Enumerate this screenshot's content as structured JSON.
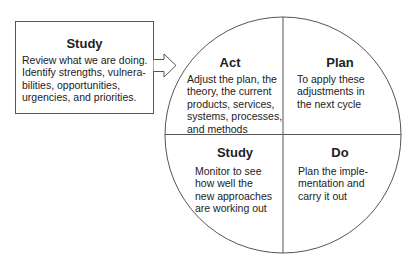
{
  "input_box": {
    "title": "Study",
    "lines": [
      "Review what we are doing.",
      "Identify strengths, vulnera-",
      "bilities, opportunities,",
      "urgencies, and priorities."
    ]
  },
  "cycle": {
    "quadrants": [
      {
        "position": "top-left",
        "title": "Act",
        "lines": [
          "Adjust the plan, the",
          "theory, the current",
          "products, services,",
          "systems, processes,",
          "and methods"
        ]
      },
      {
        "position": "top-right",
        "title": "Plan",
        "lines": [
          "To apply these",
          "adjustments in",
          "the next cycle"
        ]
      },
      {
        "position": "bottom-left",
        "title": "Study",
        "lines": [
          "Monitor to see",
          "how well the",
          "new approaches",
          "are working out"
        ]
      },
      {
        "position": "bottom-right",
        "title": "Do",
        "lines": [
          "Plan the imple-",
          "mentation and",
          "carry it out"
        ]
      }
    ]
  },
  "colors": {
    "line": "#555555",
    "text": "#222222",
    "background": "#ffffff"
  }
}
